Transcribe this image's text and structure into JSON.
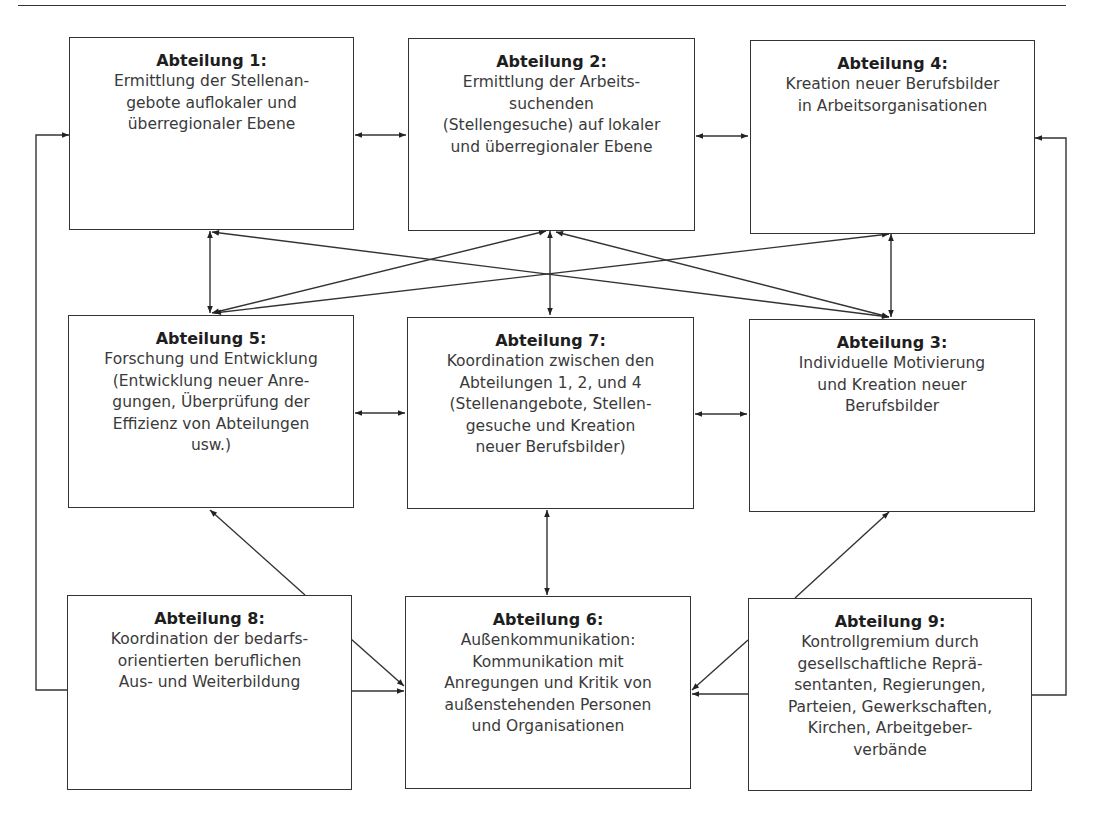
{
  "diagram": {
    "line_color": "#333333",
    "boxes": [
      {
        "id": "1",
        "title": "Abteilung 1:",
        "desc": "Ermittlung der Stellenan-\ngebote auflokaler und\nüberregionaler Ebene"
      },
      {
        "id": "2",
        "title": "Abteilung 2:",
        "desc": "Ermittlung der Arbeits-\nsuchenden\n(Stellengesuche) auf lokaler\nund überregionaler Ebene"
      },
      {
        "id": "4",
        "title": "Abteilung 4:",
        "desc": "Kreation neuer Berufsbilder\nin Arbeitsorganisationen"
      },
      {
        "id": "5",
        "title": "Abteilung 5:",
        "desc": "Forschung und Entwicklung\n(Entwicklung neuer Anre-\ngungen, Überprüfung der\nEffizienz von Abteilungen\nusw.)"
      },
      {
        "id": "7",
        "title": "Abteilung 7:",
        "desc": "Koordination zwischen den\nAbteilungen 1, 2, und 4\n(Stellenangebote, Stellen-\ngesuche und Kreation\nneuer Berufsbilder)"
      },
      {
        "id": "3",
        "title": "Abteilung 3:",
        "desc": "Individuelle Motivierung\nund Kreation neuer\nBerufsbilder"
      },
      {
        "id": "8",
        "title": "Abteilung 8:",
        "desc": "Koordination der bedarfs-\norientierten beruflichen\nAus- und Weiterbildung"
      },
      {
        "id": "6",
        "title": "Abteilung 6:",
        "desc": "Außenkommunikation:\nKommunikation mit\nAnregungen und Kritik von\naußenstehenden Personen\nund Organisationen"
      },
      {
        "id": "9",
        "title": "Abteilung 9:",
        "desc": "Kontrollgremium durch\ngesellschaftliche Reprä-\nsentanten, Regierungen,\nParteien, Gewerkschaften,\nKirchen, Arbeitgeber-\nverbände"
      }
    ],
    "edges": [
      {
        "from": "1",
        "to": "2",
        "type": "bidirectional"
      },
      {
        "from": "2",
        "to": "4",
        "type": "bidirectional"
      },
      {
        "from": "5",
        "to": "7",
        "type": "bidirectional"
      },
      {
        "from": "7",
        "to": "3",
        "type": "bidirectional"
      },
      {
        "from": "1",
        "to": "5",
        "type": "bidirectional"
      },
      {
        "from": "2",
        "to": "7",
        "type": "bidirectional"
      },
      {
        "from": "4",
        "to": "3",
        "type": "bidirectional"
      },
      {
        "from": "1",
        "to": "3",
        "type": "bidirectional"
      },
      {
        "from": "5",
        "to": "2",
        "type": "bidirectional"
      },
      {
        "from": "5",
        "to": "4",
        "type": "bidirectional"
      },
      {
        "from": "2",
        "to": "3",
        "type": "bidirectional"
      },
      {
        "from": "7",
        "to": "6",
        "type": "bidirectional"
      },
      {
        "from": "8",
        "to": "5",
        "type": "directed"
      },
      {
        "from": "8",
        "to": "6",
        "type": "directed"
      },
      {
        "from": "8",
        "to": "1",
        "type": "directed"
      },
      {
        "from": "9",
        "to": "3",
        "type": "directed"
      },
      {
        "from": "9",
        "to": "6",
        "type": "directed"
      },
      {
        "from": "9",
        "to": "4",
        "type": "directed"
      }
    ]
  }
}
